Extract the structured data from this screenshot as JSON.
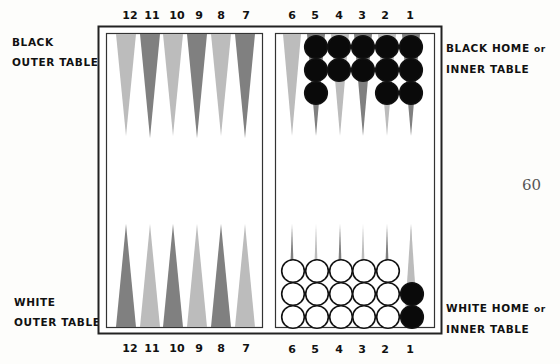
{
  "labels": {
    "black_outer": [
      "BLACK",
      "OUTER TABLE"
    ],
    "black_home": [
      "BLACK HOME",
      "or",
      "INNER TABLE"
    ],
    "white_outer": [
      "WHITE",
      "OUTER TABLE"
    ],
    "white_home": [
      "WHITE HOME",
      "or",
      "INNER TABLE"
    ]
  },
  "point_numbers": {
    "top_left": [
      "12",
      "11",
      "10",
      "9",
      "8",
      "7"
    ],
    "top_right": [
      "6",
      "5",
      "4",
      "3",
      "2",
      "1"
    ],
    "bottom_left": [
      "12",
      "11",
      "10",
      "9",
      "8",
      "7"
    ],
    "bottom_right": [
      "6",
      "5",
      "4",
      "3",
      "2",
      "1"
    ]
  },
  "page_number": "60",
  "colors": {
    "dark_point": "#808080",
    "light_point": "#bcbcbc",
    "black_checker": "#0a0a0a",
    "white_checker": "#ffffff",
    "frame": "#222222"
  },
  "checkers": {
    "black_home_top": {
      "5": 3,
      "4": 2,
      "3": 2,
      "2": 3,
      "1": 3
    },
    "white_home_bottom": {
      "6": 3,
      "5": 3,
      "4": 3,
      "3": 3,
      "2": 3
    },
    "black_on_white_point_1": 2
  }
}
